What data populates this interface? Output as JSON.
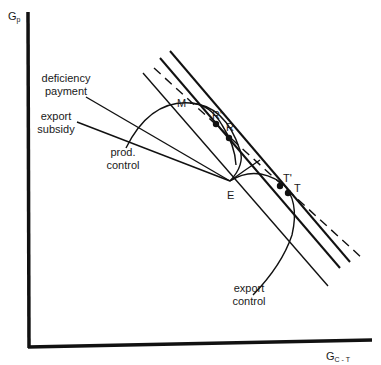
{
  "axes": {
    "y_label": "G",
    "y_sub": "p",
    "x_label": "G",
    "x_sub": "C - T"
  },
  "labels": {
    "deficiency_payment_1": "deficiency",
    "deficiency_payment_2": "payment",
    "export_subsidy_1": "export",
    "export_subsidy_2": "subsidy",
    "prod_control_1": "prod.",
    "prod_control_2": "control",
    "export_control_1": "export",
    "export_control_2": "control"
  },
  "points": {
    "M": "M",
    "R_prime": "R'",
    "R": "R",
    "E": "E",
    "T_prime": "T'",
    "T": "T"
  },
  "colors": {
    "ink": "#111111",
    "background": "#ffffff"
  }
}
